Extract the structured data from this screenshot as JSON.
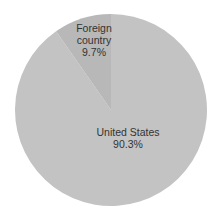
{
  "chart_data": {
    "type": "pie",
    "title": "",
    "categories": [
      "United States",
      "Foreign country"
    ],
    "values": [
      90.3,
      9.7
    ],
    "unit": "%",
    "colors": [
      "#c3c3c3",
      "#b8b8b8"
    ],
    "labels": [
      {
        "name": "United States",
        "value_label": "90.3%"
      },
      {
        "name_line1": "Foreign",
        "name_line2": "country",
        "value_label": "9.7%"
      }
    ],
    "start_angle_deg": 0,
    "direction": "counter-clockwise for foreign slice from 12 o'clock",
    "legend": "none (inline labels)"
  },
  "labels": {
    "foreign_line1": "Foreign",
    "foreign_line2": "country",
    "foreign_value": "9.7%",
    "us_name": "United States",
    "us_value": "90.3%"
  }
}
